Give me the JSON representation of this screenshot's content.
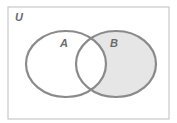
{
  "diagram": {
    "type": "venn",
    "universe_label": "U",
    "sets": [
      {
        "label": "A",
        "shaded": false
      },
      {
        "label": "B",
        "shaded": true
      }
    ],
    "shaded_region": "B only (B \\ A)",
    "colors": {
      "background": "#ffffff",
      "border": "#c8c8c8",
      "circle_stroke": "#8a8a8a",
      "shade": "#e6e6e6",
      "label": "#6b6b6b"
    }
  }
}
